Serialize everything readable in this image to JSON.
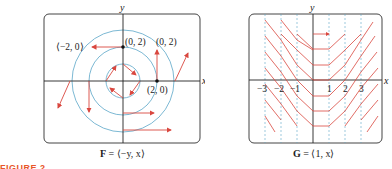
{
  "figure": {
    "label": "FIGURE 2",
    "accent_color": "#e8562a",
    "arrow_color": "#d9473f",
    "curve_color": "#5aa6c8",
    "axis_color": "#222222"
  },
  "panels": [
    {
      "id": "F",
      "caption_bold": "F",
      "caption_rest": " = ⟨−y, x⟩",
      "axis_x_label": "x",
      "axis_y_label": "y",
      "point_labels": [
        {
          "text": "(0, 2)",
          "at": [
            0,
            2
          ]
        },
        {
          "text": "(0, 2)",
          "at": [
            2,
            2
          ]
        },
        {
          "text": "⟨−2, 0⟩",
          "at": [
            -2,
            2
          ]
        },
        {
          "text": "(2, 0)",
          "at": [
            2,
            0
          ]
        }
      ],
      "circles_radii": [
        1,
        2,
        3
      ]
    },
    {
      "id": "G",
      "caption_bold": "G",
      "caption_rest": " = ⟨1, x⟩",
      "axis_x_label": "x",
      "axis_y_label": "y",
      "x_ticks": [
        "−3",
        "−2",
        "−1",
        "1",
        "2",
        "3"
      ]
    }
  ]
}
